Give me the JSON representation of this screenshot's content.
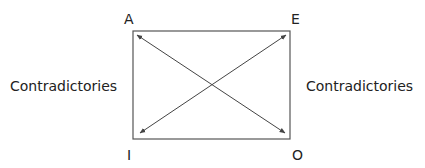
{
  "diagram": {
    "corners": {
      "top_left": "A",
      "top_right": "E",
      "bottom_left": "I",
      "bottom_right": "O"
    },
    "side_labels": {
      "left": "Contradictories",
      "right": "Contradictories"
    },
    "relations": [
      {
        "from": "A",
        "to": "O",
        "type": "contradictories",
        "arrows": "both"
      },
      {
        "from": "E",
        "to": "I",
        "type": "contradictories",
        "arrows": "both"
      }
    ],
    "colors": {
      "stroke": "#444444",
      "text": "#222222"
    }
  }
}
